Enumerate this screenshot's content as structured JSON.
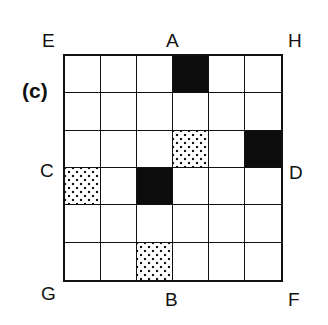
{
  "figure": {
    "panel_label": "(c)",
    "corner_labels": {
      "top_left": "E",
      "top_right": "H",
      "bottom_left": "G",
      "bottom_right": "F"
    },
    "edge_labels": {
      "top": "A",
      "bottom": "B",
      "left": "C",
      "right": "D"
    },
    "grid": {
      "rows": 6,
      "cols": 6,
      "cells": [
        [
          "white",
          "white",
          "white",
          "black",
          "white",
          "white"
        ],
        [
          "white",
          "white",
          "white",
          "white",
          "white",
          "white"
        ],
        [
          "white",
          "white",
          "white",
          "dotted",
          "white",
          "black"
        ],
        [
          "dotted",
          "white",
          "black",
          "white",
          "white",
          "white"
        ],
        [
          "white",
          "white",
          "white",
          "white",
          "white",
          "white"
        ],
        [
          "white",
          "white",
          "dotted",
          "white",
          "white",
          "white"
        ]
      ]
    },
    "colors": {
      "black": "#0d0d0d",
      "white": "#ffffff",
      "line": "#111111"
    }
  }
}
